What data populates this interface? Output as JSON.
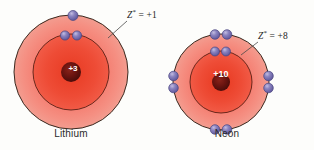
{
  "figure": {
    "type": "bohr-atomic-model-comparison",
    "background_color": "#fdfdfb"
  },
  "palette": {
    "shell_fill_outer": "#f4776b",
    "shell_fill_inner": "#ef4a38",
    "shell_core": "#e23a22",
    "shell_stroke": "#3a2a20",
    "electron_fill": "#7b74b4",
    "electron_highlight": "#b9b4da",
    "electron_stroke": "#4b4680",
    "nucleus_fill": "#6e1410",
    "text_color": "#2b2b2b",
    "leader_line_color": "#4a4a4a"
  },
  "atoms": [
    {
      "id": "lithium",
      "name": "Lithium",
      "nucleus_charge": "+3",
      "zeff_label": {
        "symbol": "Z",
        "superscript": "*",
        "equals": "=",
        "value": "+1",
        "full_text": "Z* = +1"
      },
      "shells": [
        {
          "index": 1,
          "electron_count": 2
        },
        {
          "index": 2,
          "electron_count": 1
        }
      ],
      "total_electrons": 3
    },
    {
      "id": "neon",
      "name": "Neon",
      "nucleus_charge": "+10",
      "zeff_label": {
        "symbol": "Z",
        "superscript": "*",
        "equals": "=",
        "value": "+8",
        "full_text": "Z* = +8"
      },
      "shells": [
        {
          "index": 1,
          "electron_count": 2
        },
        {
          "index": 2,
          "electron_count": 8
        }
      ],
      "total_electrons": 10
    }
  ]
}
